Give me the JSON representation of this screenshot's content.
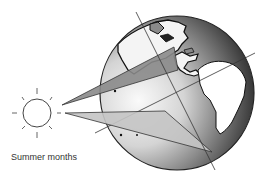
{
  "diagram": {
    "caption": "Summer months",
    "elements": {
      "sun": {
        "label": "sun",
        "center": [
          37,
          113
        ],
        "radius": 14
      },
      "earth": {
        "label": "earth-globe",
        "center": [
          177,
          93
        ],
        "radius": 77
      },
      "upper_beam": {
        "label": "sunlight-beam-northern",
        "points": [
          [
            62,
            105
          ],
          [
            174,
            47
          ],
          [
            178,
            70
          ]
        ],
        "fill": "#8a8a8a"
      },
      "lower_beam": {
        "label": "sunlight-beam-southern",
        "points": [
          [
            65,
            113
          ],
          [
            165,
            111
          ],
          [
            212,
            152
          ]
        ],
        "fill": "#c4c4c4"
      },
      "axis_line": {
        "label": "earth-axis",
        "from": [
          136,
          12
        ],
        "to": [
          215,
          170
        ]
      },
      "equator_line": {
        "label": "equator-line",
        "from": [
          95,
          133
        ],
        "to": [
          255,
          53
        ]
      }
    },
    "colors": {
      "globe_light": "#f2f2f2",
      "globe_dark": "#1a1a1a",
      "outline": "#333333",
      "land_white": "#ffffff"
    }
  }
}
